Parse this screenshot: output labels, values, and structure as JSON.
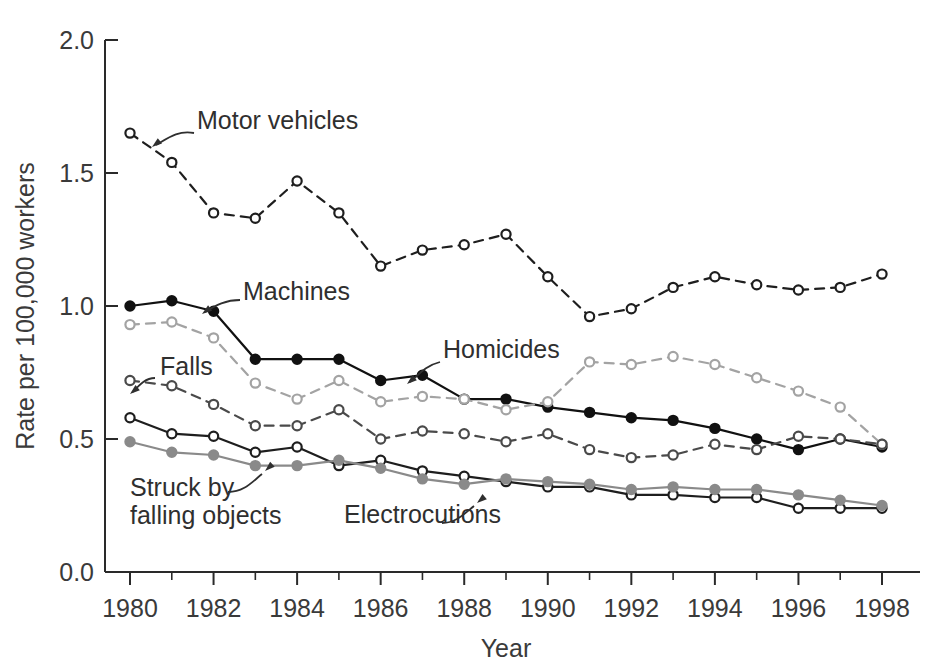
{
  "chart_data": {
    "type": "line",
    "title": "",
    "xlabel": "Year",
    "ylabel": "Rate per 100,000 workers",
    "xlim": [
      1979.5,
      1998.6
    ],
    "ylim": [
      0.0,
      2.05
    ],
    "grid": false,
    "legend_position": "inline-annotations",
    "x": [
      1980,
      1981,
      1982,
      1983,
      1984,
      1985,
      1986,
      1987,
      1988,
      1989,
      1990,
      1991,
      1992,
      1993,
      1994,
      1995,
      1996,
      1997,
      1998
    ],
    "categories": [
      "1980",
      "1981",
      "1982",
      "1983",
      "1984",
      "1985",
      "1986",
      "1987",
      "1988",
      "1989",
      "1990",
      "1991",
      "1992",
      "1993",
      "1994",
      "1995",
      "1996",
      "1997",
      "1998"
    ],
    "xticks": [
      1980,
      1982,
      1984,
      1986,
      1988,
      1990,
      1992,
      1994,
      1996,
      1998
    ],
    "xtick_labels": [
      "1980",
      "1982",
      "1984",
      "1986",
      "1988",
      "1990",
      "1992",
      "1994",
      "1996",
      "1998"
    ],
    "xticks_minor": [
      1981,
      1983,
      1985,
      1987,
      1989,
      1991,
      1993,
      1995,
      1997
    ],
    "yticks": [
      0.0,
      0.5,
      1.0,
      1.5,
      2.0
    ],
    "ytick_labels": [
      "0.0",
      "0.5",
      "1.0",
      "1.5",
      "2.0"
    ],
    "series": [
      {
        "name": "Motor vehicles",
        "label": "Motor vehicles",
        "color": "#1e1e1e",
        "linestyle": "dashed",
        "marker": "open-circle",
        "marker_fill": "#ffffff",
        "values": [
          1.65,
          1.54,
          1.35,
          1.33,
          1.47,
          1.35,
          1.15,
          1.21,
          1.23,
          1.27,
          1.11,
          0.96,
          0.99,
          1.07,
          1.11,
          1.08,
          1.06,
          1.07,
          1.12
        ]
      },
      {
        "name": "Machines",
        "label": "Machines",
        "color": "#111111",
        "linestyle": "solid",
        "marker": "filled-circle",
        "marker_fill": "#111111",
        "values": [
          1.0,
          1.02,
          0.98,
          0.8,
          0.8,
          0.8,
          0.72,
          0.74,
          0.65,
          0.65,
          0.62,
          0.6,
          0.58,
          0.57,
          0.54,
          0.5,
          0.46,
          0.5,
          0.47
        ]
      },
      {
        "name": "Homicides",
        "label": "Homicides",
        "color": "#a3a3a3",
        "linestyle": "dashed",
        "marker": "open-circle",
        "marker_fill": "#ffffff",
        "values": [
          0.93,
          0.94,
          0.88,
          0.71,
          0.65,
          0.72,
          0.64,
          0.66,
          0.65,
          0.61,
          0.64,
          0.79,
          0.78,
          0.81,
          0.78,
          0.73,
          0.68,
          0.62,
          0.48
        ]
      },
      {
        "name": "Falls",
        "label": "Falls",
        "color": "#4a4a4a",
        "linestyle": "dashed",
        "marker": "open-circle",
        "marker_fill": "#ffffff",
        "values": [
          0.72,
          0.7,
          0.63,
          0.55,
          0.55,
          0.61,
          0.5,
          0.53,
          0.52,
          0.49,
          0.52,
          0.46,
          0.43,
          0.44,
          0.48,
          0.46,
          0.51,
          0.5,
          0.48
        ]
      },
      {
        "name": "Electrocutions",
        "label": "Electrocutions",
        "color": "#1e1e1e",
        "linestyle": "solid",
        "marker": "open-circle",
        "marker_fill": "#ffffff",
        "values": [
          0.58,
          0.52,
          0.51,
          0.45,
          0.47,
          0.4,
          0.42,
          0.38,
          0.36,
          0.34,
          0.32,
          0.32,
          0.29,
          0.29,
          0.28,
          0.28,
          0.24,
          0.24,
          0.24
        ]
      },
      {
        "name": "Struck by falling objects",
        "label": "Struck by\nfalling objects",
        "color": "#8a8a8a",
        "linestyle": "solid",
        "marker": "filled-circle",
        "marker_fill": "#8a8a8a",
        "values": [
          0.49,
          0.45,
          0.44,
          0.4,
          0.4,
          0.42,
          0.39,
          0.35,
          0.33,
          0.35,
          0.34,
          0.33,
          0.31,
          0.32,
          0.31,
          0.31,
          0.29,
          0.27,
          0.25
        ]
      }
    ],
    "annotations": [
      {
        "name": "motor-vehicles",
        "text": "Motor vehicles",
        "x": 197,
        "y": 129
      },
      {
        "name": "machines",
        "text": "Machines",
        "x": 243,
        "y": 300
      },
      {
        "name": "homicides",
        "text": "Homicides",
        "x": 443,
        "y": 358
      },
      {
        "name": "falls",
        "text": "Falls",
        "x": 160,
        "y": 375
      },
      {
        "name": "struck-by-falling-objects-line1",
        "text": "Struck by",
        "x": 130,
        "y": 496
      },
      {
        "name": "struck-by-falling-objects-line2",
        "text": "falling objects",
        "x": 130,
        "y": 524
      },
      {
        "name": "electrocutions",
        "text": "Electrocutions",
        "x": 344,
        "y": 523
      }
    ]
  }
}
